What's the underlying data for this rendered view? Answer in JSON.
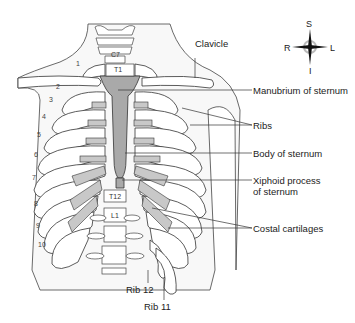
{
  "diagram": {
    "compass": {
      "superior": "S",
      "inferior": "I",
      "right": "R",
      "left": "L"
    },
    "labels": {
      "clavicle": "Clavicle",
      "manubrium": "Manubrium of sternum",
      "ribs": "Ribs",
      "body_of_sternum": "Body of sternum",
      "xiphoid_line1": "Xiphoid process",
      "xiphoid_line2": "of sternum",
      "costal_cartilages": "Costal cartilages",
      "rib12": "Rib 12",
      "rib11": "Rib 11"
    },
    "vertebrae": {
      "c7": "C7",
      "t1": "T1",
      "t12": "T12",
      "l1": "L1"
    },
    "rib_numbers": [
      "1",
      "2",
      "3",
      "4",
      "5",
      "6",
      "7",
      "8",
      "9",
      "10"
    ],
    "colors": {
      "bone": "#ffffff",
      "cartilage": "#c8c8c8",
      "sternum": "#a9a9a9",
      "outline": "#333333",
      "skin": "#f7f7f7"
    }
  }
}
